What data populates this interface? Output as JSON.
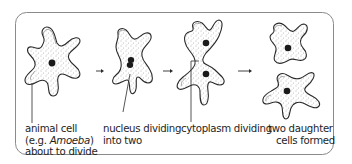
{
  "diagram": {
    "frame": {
      "stroke": "#8a8a8a",
      "background": "#ffffff"
    },
    "colors": {
      "outline": "#2a2a2a",
      "nucleus": "#1a1a1a",
      "stipple": "#6a6a6a",
      "text": "#1e1e1e"
    },
    "stages": [
      {
        "id": "stage-1",
        "label_lines": [
          "animal cell",
          "(e.g. ",
          "Amoeba",
          ")",
          "about to divide"
        ],
        "line1": "animal cell",
        "line2_prefix": "(e.g. ",
        "line2_italic": "Amoeba",
        "line2_suffix": ")",
        "line3": "about to divide"
      },
      {
        "id": "stage-2",
        "line1": "nucleus dividing",
        "line2": "into two"
      },
      {
        "id": "stage-3",
        "line1": "cytoplasm dividing"
      },
      {
        "id": "stage-4",
        "line1": "two daughter",
        "line2": "cells formed"
      }
    ],
    "arrows": 3
  }
}
